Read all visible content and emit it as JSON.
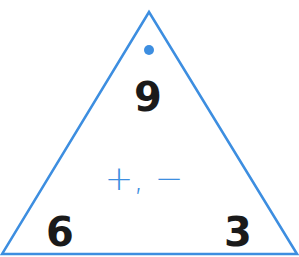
{
  "triangle": {
    "top": "9",
    "bottom_left": "6",
    "bottom_right": "3",
    "operations": "+, −"
  },
  "colors": {
    "accent": "#3d8ee0",
    "text": "#1a1a1a"
  }
}
